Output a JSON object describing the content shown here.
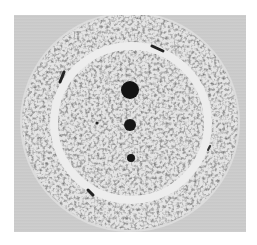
{
  "image": {
    "description": "Grayscale photograph of a circular speckled disc with a bright inner ring and three dark dots in a vertical line",
    "colors": {
      "background": "#c9c9c9",
      "speckle_light": "#e6e6e6",
      "speckle_dark": "#5a5a5a",
      "ring": "#ececec",
      "dots": "#141414"
    },
    "dots": [
      {
        "cx": 130,
        "cy": 90,
        "r": 9
      },
      {
        "cx": 130,
        "cy": 125,
        "r": 6
      },
      {
        "cx": 131,
        "cy": 158,
        "r": 4
      }
    ]
  }
}
